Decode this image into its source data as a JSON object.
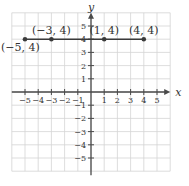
{
  "chart_data": {
    "type": "scatter",
    "title": "",
    "xlabel": "x",
    "ylabel": "y",
    "xlim": [
      -6,
      6
    ],
    "ylim": [
      -6,
      6
    ],
    "grid": true,
    "x_ticks": [
      -5,
      -4,
      -3,
      -2,
      -1,
      1,
      2,
      3,
      4,
      5
    ],
    "y_ticks": [
      -5,
      -4,
      -3,
      -2,
      -1,
      1,
      2,
      3,
      4,
      5
    ],
    "x_tick_labels": [
      "−5",
      "−4",
      "−3",
      "−2",
      "−1",
      "1",
      "2",
      "3",
      "4",
      "5"
    ],
    "y_tick_labels": [
      "−5",
      "−4",
      "−3",
      "−2",
      "−1",
      "1",
      "2",
      "3",
      "4",
      "5"
    ],
    "series": [
      {
        "name": "horizontal line y = 4",
        "x": [
          -5,
          -3,
          1,
          4
        ],
        "y": [
          4,
          4,
          4,
          4
        ],
        "connected": true
      }
    ],
    "points": [
      {
        "x": -5,
        "y": 4,
        "label": "(−5, 4)"
      },
      {
        "x": -3,
        "y": 4,
        "label": "(−3, 4)"
      },
      {
        "x": 1,
        "y": 4,
        "label": "(1, 4)"
      },
      {
        "x": 4,
        "y": 4,
        "label": "(4, 4)"
      }
    ]
  }
}
